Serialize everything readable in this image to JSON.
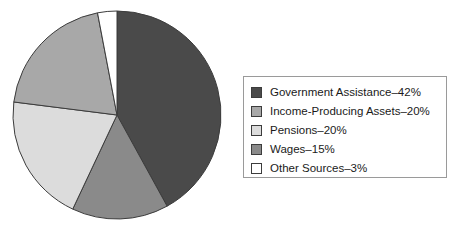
{
  "chart_data": {
    "type": "pie",
    "title": "",
    "subtitle": "",
    "xlabel": "",
    "ylabel": "",
    "grid": false,
    "legend_position": "right",
    "start_angle_deg": 0,
    "direction": "clockwise",
    "value_unit": "%",
    "total": 100,
    "categories": [
      "Government Assistance",
      "Income-Producing Assets",
      "Pensions",
      "Wages",
      "Other Sources"
    ],
    "values": [
      42,
      20,
      20,
      15,
      3
    ],
    "colors": [
      "#4a4a4a",
      "#a8a8a8",
      "#dcdcdc",
      "#8a8a8a",
      "#ffffff"
    ],
    "slice_order_clockwise_from_top": [
      "Government Assistance",
      "Wages",
      "Pensions",
      "Income-Producing Assets",
      "Other Sources"
    ],
    "slices": [
      {
        "label": "Government Assistance",
        "value": 42,
        "color": "#4a4a4a",
        "legend_text": "Government Assistance–42%"
      },
      {
        "label": "Wages",
        "value": 15,
        "color": "#8a8a8a",
        "legend_text": "Wages–15%"
      },
      {
        "label": "Pensions",
        "value": 20,
        "color": "#dcdcdc",
        "legend_text": "Pensions–20%"
      },
      {
        "label": "Income-Producing Assets",
        "value": 20,
        "color": "#a8a8a8",
        "legend_text": "Income-Producing Assets–20%"
      },
      {
        "label": "Other Sources",
        "value": 3,
        "color": "#ffffff",
        "legend_text": "Other Sources–3%"
      }
    ]
  },
  "legend": {
    "items": [
      {
        "label": "Government Assistance–42%",
        "color": "#4a4a4a"
      },
      {
        "label": "Income-Producing Assets–20%",
        "color": "#a8a8a8"
      },
      {
        "label": "Pensions–20%",
        "color": "#dcdcdc"
      },
      {
        "label": "Wages–15%",
        "color": "#8a8a8a"
      },
      {
        "label": "Other Sources–3%",
        "color": "#ffffff"
      }
    ]
  },
  "geometry": {
    "pie_center_x": 117,
    "pie_center_y": 115,
    "pie_radius": 104
  },
  "style": {
    "background": "#ffffff",
    "outline": "#3c3c3c",
    "legend_border": "#9a9a9a",
    "text_color": "#1a1a1a"
  }
}
